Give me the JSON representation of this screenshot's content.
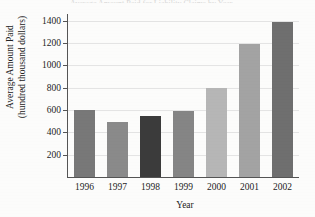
{
  "figure": {
    "background_color": "#fcfcfb",
    "title_remnant": "Average Amount Paid for Liability Claims by Year"
  },
  "chart_data": {
    "type": "bar",
    "title": "",
    "xlabel": "Year",
    "ylabel": "Average Amount Paid (hundred thousand dollars)",
    "ylabel_line1": "Average Amount Paid",
    "ylabel_line2": "(hundred thousand dollars)",
    "categories": [
      "1996",
      "1997",
      "1998",
      "1999",
      "2000",
      "2001",
      "2002"
    ],
    "values": [
      600,
      495,
      545,
      590,
      795,
      1190,
      1390
    ],
    "bar_colors": [
      "#787878",
      "#8a8a8a",
      "#3b3b3b",
      "#858585",
      "#b6b6b6",
      "#a3a3a3",
      "#6f6f6f"
    ],
    "ylim": [
      0,
      1460
    ],
    "ytick_values": [
      200,
      400,
      600,
      800,
      1000,
      1200,
      1400
    ],
    "ytick_labels": [
      "200",
      "400",
      "600",
      "800",
      "1000",
      "1200",
      "1400"
    ],
    "grid": true,
    "grid_axis": "y",
    "legend": "none",
    "axis_color": "#555555",
    "grid_color": "#e4e4e4"
  }
}
